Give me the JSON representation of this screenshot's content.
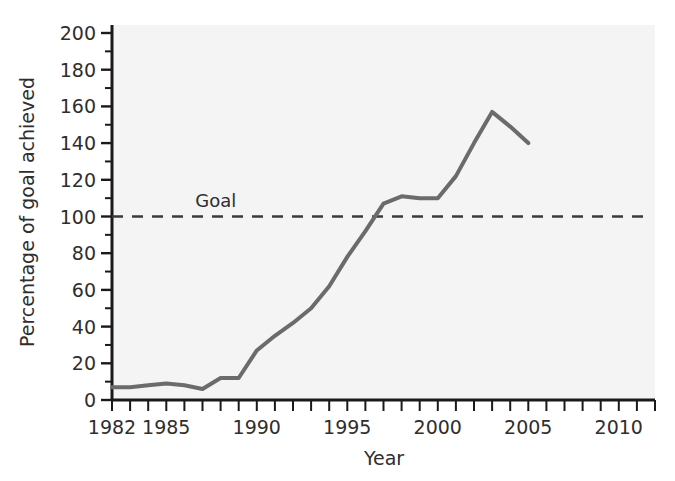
{
  "chart_data": {
    "type": "line",
    "title": "",
    "subtitle": "",
    "xlabel": "Year",
    "ylabel": "Percentage of goal achieved",
    "xlim": [
      1982,
      2012
    ],
    "ylim": [
      0,
      200
    ],
    "grid": false,
    "legend_position": "none",
    "x_ticks_major": [
      1982,
      1985,
      1990,
      1995,
      2000,
      2005,
      2010
    ],
    "x_tick_labels": [
      "1982",
      "1985",
      "1990",
      "1995",
      "2000",
      "2005",
      "2010"
    ],
    "x_tick_minor_step": 1,
    "y_ticks_major": [
      0,
      20,
      40,
      60,
      80,
      100,
      120,
      140,
      160,
      180,
      200
    ],
    "y_tick_labels": [
      "0",
      "20",
      "40",
      "60",
      "80",
      "100",
      "120",
      "140",
      "160",
      "180",
      "200"
    ],
    "y_tick_minor_step": 10,
    "series": [
      {
        "name": "Percentage of goal achieved",
        "color": "#6b6b6b",
        "line_width": 4,
        "x": [
          1982,
          1983,
          1984,
          1985,
          1986,
          1987,
          1988,
          1989,
          1990,
          1991,
          1992,
          1993,
          1994,
          1995,
          1996,
          1997,
          1998,
          1999,
          2000,
          2001,
          2002,
          2003,
          2004,
          2005
        ],
        "values": [
          7,
          7,
          8,
          9,
          8,
          6,
          12,
          12,
          27,
          35,
          42,
          50,
          62,
          78,
          92,
          107,
          111,
          110,
          110,
          122,
          140,
          157,
          149,
          140
        ]
      }
    ],
    "annotations": [
      {
        "name": "goal-line",
        "label": "Goal",
        "type": "horizontal-reference-line",
        "value": 100,
        "style": "dashed",
        "color": "#3a3a3a",
        "label_x": 1986.6
      }
    ],
    "plot_background": "#f4f4f4",
    "axis_color": "#1a1a1a"
  },
  "axis": {
    "x_title": "Year",
    "y_title": "Percentage of goal achieved"
  }
}
